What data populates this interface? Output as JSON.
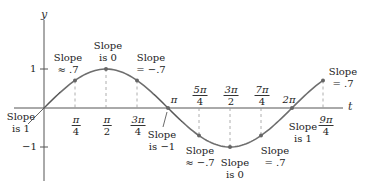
{
  "axes": {
    "x_label": "t",
    "y_label": "y"
  },
  "y_ticks": [
    {
      "label": "1",
      "value": 1
    },
    {
      "label": "−1",
      "value": -1
    }
  ],
  "x_ticks_fraction": [
    {
      "num": "π",
      "den": "4",
      "value": 0.785
    },
    {
      "num": "π",
      "den": "2",
      "value": 1.571
    },
    {
      "num": "3π",
      "den": "4",
      "value": 2.356
    },
    {
      "num": "5π",
      "den": "4",
      "value": 3.927
    },
    {
      "num": "3π",
      "den": "2",
      "value": 4.712
    },
    {
      "num": "7π",
      "den": "4",
      "value": 5.498
    },
    {
      "num": "9π",
      "den": "4",
      "value": 7.069
    }
  ],
  "x_ticks_simple": [
    {
      "label": "π",
      "value": 3.1416
    },
    {
      "label": "2π",
      "value": 6.2832
    }
  ],
  "annotations": [
    {
      "line1": "Slope",
      "line2": "is 1",
      "at": "0"
    },
    {
      "line1": "Slope",
      "line2": "≈ .7",
      "at": "π/4"
    },
    {
      "line1": "Slope",
      "line2": "is 0",
      "at": "π/2"
    },
    {
      "line1": "Slope",
      "line2": "= −.7",
      "at": "3π/4"
    },
    {
      "line1": "Slope",
      "line2": "is −1",
      "at": "π"
    },
    {
      "line1": "Slope",
      "line2": "≈ −.7",
      "at": "5π/4"
    },
    {
      "line1": "Slope",
      "line2": "is 0",
      "at": "3π/2"
    },
    {
      "line1": "Slope",
      "line2": "= .7",
      "at": "7π/4"
    },
    {
      "line1": "Slope",
      "line2": "is 1",
      "at": "2π"
    },
    {
      "line1": "Slope",
      "line2": "= .7",
      "at": "9π/4"
    }
  ],
  "curve": {
    "function": "sin(t)",
    "t_range": [
      0,
      7.069
    ],
    "color": "#6e6e6e"
  }
}
